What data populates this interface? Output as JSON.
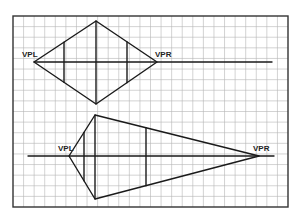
{
  "diagram": {
    "type": "two-point-perspective",
    "grid": {
      "left": 13,
      "top": 16,
      "right": 288,
      "bottom": 207,
      "cols": 26,
      "rows": 18
    },
    "top_figure": {
      "labels": {
        "vpl": "VPL",
        "vpr": "VPR"
      },
      "horizon": {
        "y": 62,
        "x1": 34,
        "x2": 272
      },
      "vpl": [
        34,
        62
      ],
      "vpr": [
        157,
        62
      ],
      "top": [
        96,
        21
      ],
      "bottom": [
        96,
        104
      ],
      "verticals": [
        64,
        96,
        127
      ]
    },
    "bottom_figure": {
      "labels": {
        "vpl": "VPL",
        "vpr": "VPR"
      },
      "horizon": {
        "y": 156,
        "x1": 28,
        "x2": 274
      },
      "vpl": [
        69,
        156
      ],
      "vpr": [
        259,
        156
      ],
      "top": [
        95,
        115
      ],
      "bottom": [
        95,
        199
      ],
      "verticals": [
        84,
        95,
        146
      ]
    }
  }
}
